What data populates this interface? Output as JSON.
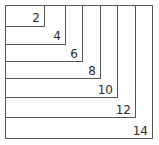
{
  "diagram": {
    "type": "nested-rectangles",
    "canvas": {
      "width": 159,
      "height": 145,
      "background": "#ffffff"
    },
    "stroke_color": "#565656",
    "stroke_width": 1,
    "label_color": "#2b2b2b",
    "label_font_size": 12,
    "origin": {
      "x": 5,
      "y": 5
    },
    "rectangles": [
      {
        "label": "2",
        "x": 5,
        "y": 5,
        "right": 44,
        "bottom": 26,
        "width": 39,
        "height": 21,
        "label_x": 40,
        "label_y": 22
      },
      {
        "label": "4",
        "x": 5,
        "y": 5,
        "right": 65,
        "bottom": 44,
        "width": 60,
        "height": 39,
        "label_x": 61,
        "label_y": 40
      },
      {
        "label": "6",
        "x": 5,
        "y": 5,
        "right": 82,
        "bottom": 61,
        "width": 77,
        "height": 56,
        "label_x": 78,
        "label_y": 58
      },
      {
        "label": "8",
        "x": 5,
        "y": 5,
        "right": 100,
        "bottom": 78,
        "width": 95,
        "height": 73,
        "label_x": 96,
        "label_y": 75
      },
      {
        "label": "10",
        "x": 5,
        "y": 5,
        "right": 117,
        "bottom": 97,
        "width": 112,
        "height": 92,
        "label_x": 113,
        "label_y": 94
      },
      {
        "label": "12",
        "x": 5,
        "y": 5,
        "right": 135,
        "bottom": 117,
        "width": 130,
        "height": 112,
        "label_x": 131,
        "label_y": 114
      },
      {
        "label": "14",
        "x": 5,
        "y": 5,
        "right": 152,
        "bottom": 138,
        "width": 147,
        "height": 133,
        "label_x": 148,
        "label_y": 135
      }
    ]
  },
  "chart_data": {
    "type": "diagram",
    "categories": [
      "2",
      "4",
      "6",
      "8",
      "10",
      "12",
      "14"
    ],
    "values": [
      2,
      4,
      6,
      8,
      10,
      12,
      14
    ],
    "xlabel": "",
    "ylabel": "",
    "legend": [],
    "grid": false
  }
}
